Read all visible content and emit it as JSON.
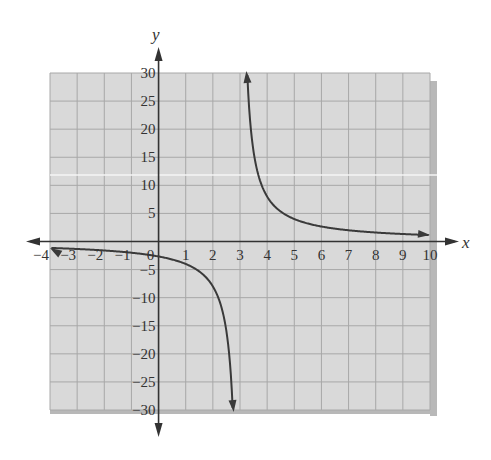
{
  "chart_data": {
    "type": "line",
    "title": "",
    "xlabel": "x",
    "ylabel": "y",
    "xlim": [
      -4,
      10
    ],
    "ylim": [
      -30,
      30
    ],
    "grid": true,
    "legend": null,
    "function": "y = 8/(x - 3)",
    "vertical_asymptote": 3,
    "horizontal_asymptote": 0,
    "x_ticks": [
      "-4",
      "-3",
      "-2",
      "-1",
      "0",
      "1",
      "2",
      "3",
      "4",
      "5",
      "6",
      "7",
      "8",
      "9",
      "10"
    ],
    "y_ticks": [
      "30",
      "25",
      "20",
      "15",
      "10",
      "5",
      "-5",
      "-10",
      "-15",
      "-20",
      "-25",
      "-30"
    ],
    "series": [
      {
        "name": "left branch",
        "x": [
          -4,
          -3,
          -2,
          -1,
          0,
          1,
          2,
          2.5,
          2.73
        ],
        "values": [
          -1.14,
          -1.33,
          -1.6,
          -2,
          -2.67,
          -4,
          -8,
          -16,
          -30
        ]
      },
      {
        "name": "right branch",
        "x": [
          3.27,
          3.5,
          4,
          5,
          6,
          7,
          8,
          9,
          10
        ],
        "values": [
          30,
          16,
          8,
          4,
          2.67,
          2,
          1.6,
          1.33,
          1.14
        ]
      }
    ],
    "colors": {
      "grid_background": "#d9d9d9",
      "grid_line": "#a8a8a8",
      "curve": "#3a3a3a",
      "axis": "#333333",
      "shadow": "#b8b8b8"
    }
  }
}
